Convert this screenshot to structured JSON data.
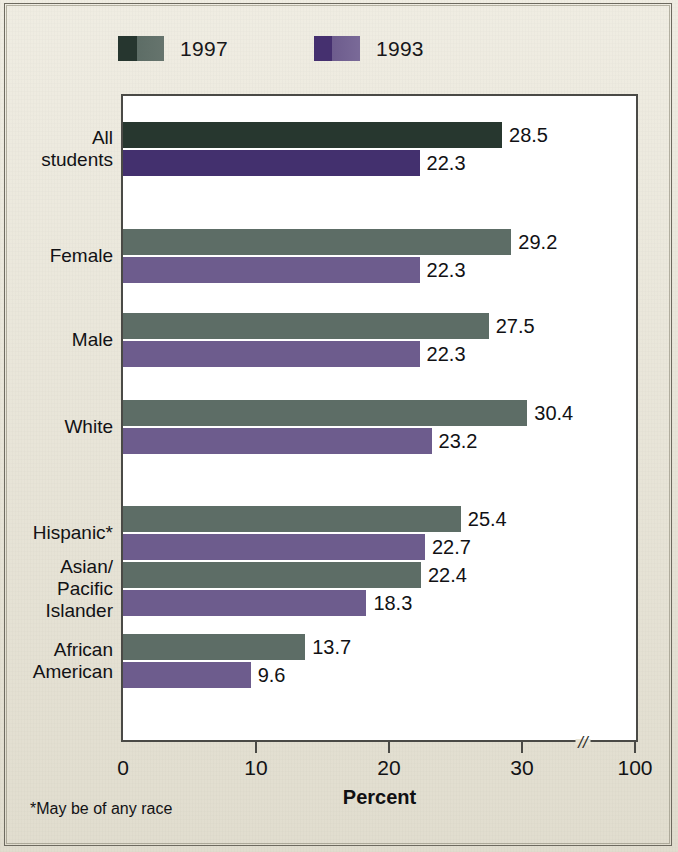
{
  "figure": {
    "background_color": "#e9e5d6",
    "plot_background_color": "#ffffff",
    "axis_color": "#4a4a46"
  },
  "legend": {
    "entries": [
      {
        "label": "1997",
        "color": "#5d6d66",
        "dark_color": "#27372f"
      },
      {
        "label": "1993",
        "color": "#6d5c8d",
        "dark_color": "#43306e"
      }
    ]
  },
  "axis": {
    "ticks": [
      "0",
      "10",
      "20",
      "30",
      "100"
    ],
    "tick_values": [
      0,
      10,
      20,
      30,
      100
    ],
    "title": "Percent",
    "break_marker": "//"
  },
  "footnote": "*May be of any race",
  "chart_data": {
    "type": "bar",
    "orientation": "horizontal",
    "title": "",
    "subtitle": "",
    "xlabel": "Percent",
    "ylabel": "",
    "xlim": [
      0,
      100
    ],
    "xticks": [
      0,
      10,
      20,
      30,
      100
    ],
    "axis_break": {
      "after": 30,
      "before": 100,
      "marker": "//"
    },
    "grid": false,
    "legend_position": "top-left",
    "categories": [
      "All students",
      "Female",
      "Male",
      "White",
      "Hispanic*",
      "Asian/ Pacific Islander",
      "African American"
    ],
    "category_lines": [
      [
        "All",
        "students"
      ],
      [
        "Female"
      ],
      [
        "Male"
      ],
      [
        "White"
      ],
      [
        "Hispanic*"
      ],
      [
        "Asian/",
        "Pacific",
        "Islander"
      ],
      [
        "African",
        "American"
      ]
    ],
    "series": [
      {
        "name": "1997",
        "color": "#5d6d66",
        "values": [
          28.5,
          29.2,
          27.5,
          30.4,
          25.4,
          22.4,
          13.7
        ],
        "labels": [
          "28.5",
          "29.2",
          "27.5",
          "30.4",
          "25.4",
          "22.4",
          "13.7"
        ]
      },
      {
        "name": "1993",
        "color": "#6d5c8d",
        "values": [
          22.3,
          22.3,
          22.3,
          23.2,
          22.7,
          18.3,
          9.6
        ],
        "labels": [
          "22.3",
          "22.3",
          "22.3",
          "23.2",
          "22.7",
          "18.3",
          "9.6"
        ]
      }
    ]
  }
}
